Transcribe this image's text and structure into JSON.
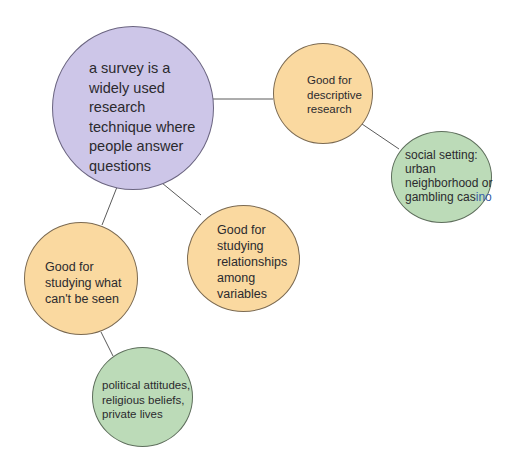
{
  "diagram": {
    "type": "concept-map",
    "colors": {
      "central_node": "#cdc6e8",
      "benefit_node": "#fad9a0",
      "example_node": "#bcdbb8",
      "connector": "#5a5a5a",
      "text": "#2b2a2e"
    },
    "nodes": {
      "central": {
        "text": "a survey is a\nwidely used\nresearch\ntechnique where\npeople answer\nquestions"
      },
      "descriptive": {
        "text": "Good for\ndescriptive\nresearch"
      },
      "social_setting": {
        "text_main": "social setting:\nurban\nneighborhood or\ngambling cas",
        "text_tail": "ino"
      },
      "relationships": {
        "text": "Good for\nstudying\nrelationships\namong\nvariables"
      },
      "cant_be_seen": {
        "text": "Good for\nstudying what\ncan't be seen"
      },
      "political": {
        "text": "political attitudes,\nreligious beliefs,\nprivate lives"
      }
    },
    "edges": [
      {
        "from": "central",
        "to": "descriptive"
      },
      {
        "from": "descriptive",
        "to": "social_setting"
      },
      {
        "from": "central",
        "to": "relationships"
      },
      {
        "from": "central",
        "to": "cant_be_seen"
      },
      {
        "from": "cant_be_seen",
        "to": "political"
      }
    ]
  }
}
